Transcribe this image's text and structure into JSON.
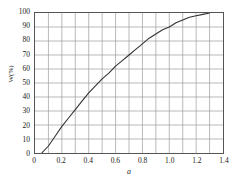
{
  "chart_data": {
    "type": "line",
    "title": "",
    "xlabel": "a",
    "ylabel": "W(%)",
    "xlim": [
      0,
      1.4
    ],
    "ylim": [
      0,
      100
    ],
    "grid": true,
    "legend": null,
    "x_major_ticks": [
      0,
      0.2,
      0.4,
      0.6,
      0.8,
      1.0,
      1.2,
      1.4
    ],
    "x_major_tick_labels": [
      "0",
      "0.2",
      "0.4",
      "0.6",
      "0.8",
      "1.0",
      "1.2",
      "1.4"
    ],
    "x_minor_gridline_step": 0.1,
    "y_major_ticks": [
      0,
      10,
      20,
      30,
      40,
      50,
      60,
      70,
      80,
      90,
      100
    ],
    "y_major_tick_labels": [
      "0",
      "10",
      "20",
      "30",
      "40",
      "50",
      "60",
      "70",
      "80",
      "90",
      "100"
    ],
    "series": [
      {
        "name": "W vs a",
        "color": "#333333",
        "x": [
          0.05,
          0.1,
          0.15,
          0.2,
          0.25,
          0.3,
          0.35,
          0.4,
          0.45,
          0.5,
          0.55,
          0.6,
          0.65,
          0.7,
          0.75,
          0.8,
          0.85,
          0.9,
          0.95,
          1.0,
          1.05,
          1.1,
          1.15,
          1.2,
          1.25,
          1.3
        ],
        "y": [
          0,
          5,
          12,
          19,
          25,
          31,
          37,
          43,
          48,
          53,
          57,
          62,
          66,
          70,
          74,
          78,
          82,
          85,
          88,
          90,
          93,
          95,
          97,
          98,
          99,
          100
        ]
      }
    ],
    "annotations": []
  },
  "style": {
    "background": "#ffffff",
    "grid_color": "#9a9a9a",
    "frame_color": "#555555",
    "curve_color": "#333333",
    "text_color": "#1a1a1a"
  }
}
